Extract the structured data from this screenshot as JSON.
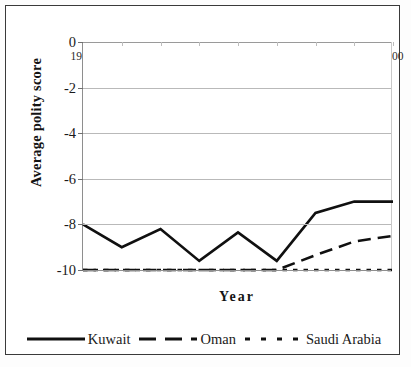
{
  "chart_data": {
    "type": "line",
    "title": "",
    "xlabel": "Year",
    "ylabel": "Average polity score",
    "x": [
      1960,
      1965,
      1970,
      1975,
      1980,
      1985,
      1990,
      1995,
      2000
    ],
    "xtick_labels": [
      "1960",
      "1965",
      "1970",
      "1975",
      "1980",
      "1985",
      "1990",
      "1995",
      "2000"
    ],
    "ytick_labels": [
      "0",
      "-2",
      "-4",
      "-6",
      "-8",
      "-10"
    ],
    "yticks": [
      0,
      -2,
      -4,
      -6,
      -8,
      -10
    ],
    "ylim": [
      -10,
      0
    ],
    "grid": true,
    "grid_axis": "y",
    "legend_position": "bottom",
    "series": [
      {
        "name": "Kuwait",
        "style": "solid",
        "color": "#101010",
        "width": 2.6,
        "values": [
          -8.0,
          -9.0,
          -8.2,
          -9.6,
          -8.35,
          -9.6,
          -7.5,
          -7.0,
          -7.0
        ]
      },
      {
        "name": "Oman",
        "style": "dashed",
        "color": "#101010",
        "width": 2.6,
        "values": [
          -10.0,
          -10.0,
          -10.0,
          -10.0,
          -10.0,
          -10.0,
          -9.35,
          -8.75,
          -8.5
        ]
      },
      {
        "name": "Saudi Arabia",
        "style": "dotted",
        "color": "#101010",
        "width": 2.6,
        "values": [
          -10.0,
          -10.0,
          -10.0,
          -10.0,
          -10.0,
          -10.0,
          -10.0,
          -10.0,
          -10.0
        ]
      }
    ]
  },
  "axes": {
    "y_title": "Average polity score",
    "x_title": "Year"
  },
  "legend": {
    "items": [
      {
        "label": "Kuwait",
        "style": "solid"
      },
      {
        "label": "Oman",
        "style": "dashed"
      },
      {
        "label": "Saudi Arabia",
        "style": "dotted"
      }
    ]
  }
}
